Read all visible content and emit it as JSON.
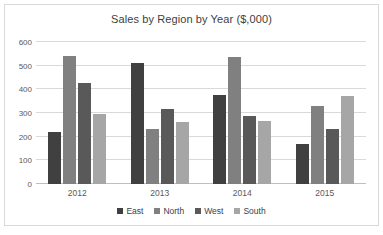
{
  "chart_data": {
    "type": "bar",
    "title": "Sales by Region by Year ($,000)",
    "xlabel": "",
    "ylabel": "",
    "categories": [
      "2012",
      "2013",
      "2014",
      "2015"
    ],
    "series": [
      {
        "name": "East",
        "color": "#404040",
        "values": [
          220,
          512,
          375,
          168
        ]
      },
      {
        "name": "North",
        "color": "#808080",
        "values": [
          540,
          232,
          535,
          330
        ]
      },
      {
        "name": "West",
        "color": "#595959",
        "values": [
          428,
          318,
          287,
          233
        ]
      },
      {
        "name": "South",
        "color": "#a6a6a6",
        "values": [
          295,
          260,
          268,
          370
        ]
      }
    ],
    "ylim": [
      0,
      600
    ],
    "yticks": [
      0,
      100,
      200,
      300,
      400,
      500,
      600
    ],
    "ytick_labels": [
      "0",
      "100",
      "200",
      "300",
      "400",
      "500",
      "600"
    ],
    "grid": true,
    "legend_position": "bottom",
    "legend_entries": [
      "East",
      "North",
      "West",
      "South"
    ]
  }
}
